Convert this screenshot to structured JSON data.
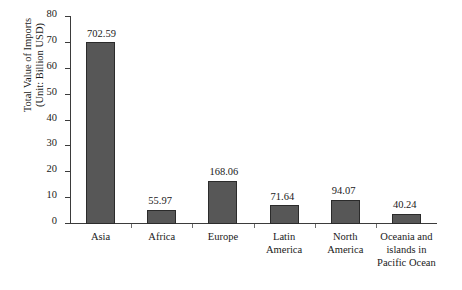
{
  "chart_data": {
    "type": "bar",
    "title": "",
    "subtitle": "",
    "xlabel": "",
    "ylabel": "Total Value of Imports\n(Unit: Billion USD)",
    "ylabel_lines": [
      "Total Value of Imports",
      "(Unit: Billion USD)"
    ],
    "categories": [
      "Asia",
      "Africa",
      "Europe",
      "Latin\nAmerica",
      "North\nAmerica",
      "Oceania and\nislands in\nPacific Ocean"
    ],
    "data_labels": [
      "702.59",
      "55.97",
      "168.06",
      "71.64",
      "94.07",
      "40.24"
    ],
    "values": [
      702.59,
      55.97,
      168.06,
      71.64,
      94.07,
      40.24
    ],
    "plotted_values": [
      70.26,
      5.6,
      16.81,
      7.16,
      9.41,
      4.02
    ],
    "ylim": [
      0,
      80
    ],
    "ytick_labels": [
      "0",
      "10",
      "20",
      "30",
      "40",
      "50",
      "60",
      "70",
      "80"
    ],
    "yticks": [
      0,
      10,
      20,
      30,
      40,
      50,
      60,
      70,
      80
    ],
    "grid": false,
    "legend": false,
    "legend_position": "none",
    "colors": {
      "bar_fill": "#575757",
      "bar_edge": "#2b2b2b",
      "axis": "#3b3b3b",
      "text": "#1a1a1a",
      "background": "#ffffff"
    }
  }
}
